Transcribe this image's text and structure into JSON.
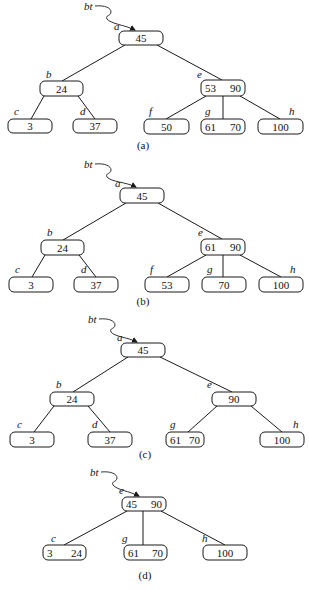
{
  "figure": {
    "pointer_label": "bt",
    "panels": [
      {
        "id": "a",
        "caption": "(a)",
        "caption_pos": [
          143,
          149
        ],
        "pointer": {
          "label_pos": [
            84,
            10
          ],
          "tip": [
            135,
            31
          ]
        },
        "nodes": [
          {
            "name": "a",
            "keys": [
              "45"
            ],
            "box": [
              119,
              31,
              44,
              14
            ],
            "label_pos": [
              114,
              31
            ]
          },
          {
            "name": "b",
            "keys": [
              "24"
            ],
            "box": [
              40,
              81,
              43,
              15
            ],
            "label_pos": [
              46,
              79
            ]
          },
          {
            "name": "c",
            "keys": [
              "3"
            ],
            "box": [
              8,
              119,
              44,
              14
            ],
            "label_pos": [
              14,
              116
            ]
          },
          {
            "name": "d",
            "keys": [
              "37"
            ],
            "box": [
              73,
              119,
              44,
              14
            ],
            "label_pos": [
              80,
              116
            ]
          },
          {
            "name": "e",
            "keys": [
              "53",
              "90"
            ],
            "box": [
              201,
              80,
              44,
              16
            ],
            "label_pos": [
              197,
              79
            ]
          },
          {
            "name": "f",
            "keys": [
              "50"
            ],
            "box": [
              144,
              119,
              45,
              15
            ],
            "label_pos": [
              149,
              116
            ]
          },
          {
            "name": "g",
            "keys": [
              "61",
              "70"
            ],
            "box": [
              201,
              119,
              44,
              15
            ],
            "label_pos": [
              205,
              116
            ]
          },
          {
            "name": "h",
            "keys": [
              "100"
            ],
            "box": [
              258,
              119,
              45,
              15
            ],
            "label_pos": [
              289,
              116
            ]
          }
        ],
        "edges": [
          [
            125,
            45,
            62,
            81
          ],
          [
            157,
            45,
            222,
            80
          ],
          [
            44,
            96,
            31,
            119
          ],
          [
            78,
            96,
            95,
            119
          ],
          [
            206,
            96,
            166,
            119
          ],
          [
            223,
            96,
            223,
            119
          ],
          [
            240,
            96,
            280,
            119
          ]
        ]
      },
      {
        "id": "b",
        "caption": "(b)",
        "caption_pos": [
          143,
          305
        ],
        "pointer": {
          "label_pos": [
            84,
            168
          ],
          "tip": [
            136,
            188
          ]
        },
        "nodes": [
          {
            "name": "a",
            "keys": [
              "45"
            ],
            "box": [
              120,
              188,
              44,
              15
            ],
            "label_pos": [
              115,
              188
            ]
          },
          {
            "name": "b",
            "keys": [
              "24"
            ],
            "box": [
              41,
              240,
              43,
              15
            ],
            "label_pos": [
              47,
              237
            ]
          },
          {
            "name": "c",
            "keys": [
              "3"
            ],
            "box": [
              9,
              277,
              44,
              15
            ],
            "label_pos": [
              15,
              274
            ]
          },
          {
            "name": "d",
            "keys": [
              "37"
            ],
            "box": [
              74,
              277,
              44,
              15
            ],
            "label_pos": [
              81,
              274
            ]
          },
          {
            "name": "e",
            "keys": [
              "61",
              "90"
            ],
            "box": [
              201,
              239,
              44,
              16
            ],
            "label_pos": [
              198,
              237
            ]
          },
          {
            "name": "f",
            "keys": [
              "53"
            ],
            "box": [
              145,
              277,
              44,
              15
            ],
            "label_pos": [
              150,
              274
            ]
          },
          {
            "name": "g",
            "keys": [
              "70"
            ],
            "box": [
              202,
              277,
              44,
              15
            ],
            "label_pos": [
              207,
              274
            ]
          },
          {
            "name": "h",
            "keys": [
              "100"
            ],
            "box": [
              259,
              277,
              44,
              15
            ],
            "label_pos": [
              290,
              274
            ]
          }
        ],
        "edges": [
          [
            126,
            203,
            63,
            240
          ],
          [
            158,
            203,
            222,
            239
          ],
          [
            45,
            255,
            32,
            277
          ],
          [
            79,
            255,
            96,
            277
          ],
          [
            206,
            255,
            167,
            277
          ],
          [
            223,
            255,
            223,
            277
          ],
          [
            240,
            255,
            281,
            277
          ]
        ]
      },
      {
        "id": "c",
        "caption": "(c)",
        "caption_pos": [
          145,
          458
        ],
        "pointer": {
          "label_pos": [
            88,
            323
          ],
          "tip": [
            137,
            343
          ]
        },
        "nodes": [
          {
            "name": "a",
            "keys": [
              "45"
            ],
            "box": [
              121,
              343,
              44,
              14
            ],
            "label_pos": [
              117,
              342
            ]
          },
          {
            "name": "b",
            "keys": [
              "24"
            ],
            "box": [
              50,
              392,
              44,
              14
            ],
            "label_pos": [
              56,
              389
            ]
          },
          {
            "name": "c",
            "keys": [
              "3"
            ],
            "box": [
              10,
              432,
              44,
              15
            ],
            "label_pos": [
              17,
              429
            ]
          },
          {
            "name": "d",
            "keys": [
              "37"
            ],
            "box": [
              88,
              432,
              44,
              15
            ],
            "label_pos": [
              92,
              429
            ]
          },
          {
            "name": "e",
            "keys": [
              "90"
            ],
            "box": [
              212,
              392,
              44,
              14
            ],
            "label_pos": [
              207,
              389
            ]
          },
          {
            "name": "g",
            "keys": [
              "61",
              "70"
            ],
            "box": [
              166,
              432,
              38,
              15
            ],
            "label_pos": [
              170,
              429
            ]
          },
          {
            "name": "h",
            "keys": [
              "100"
            ],
            "box": [
              260,
              432,
              44,
              15
            ],
            "label_pos": [
              293,
              429
            ]
          }
        ],
        "edges": [
          [
            128,
            357,
            73,
            392
          ],
          [
            160,
            357,
            232,
            392
          ],
          [
            54,
            406,
            34,
            432
          ],
          [
            88,
            406,
            110,
            432
          ],
          [
            217,
            406,
            188,
            432
          ],
          [
            251,
            406,
            282,
            432
          ]
        ]
      },
      {
        "id": "d",
        "caption": "(d)",
        "caption_pos": [
          145,
          579
        ],
        "pointer": {
          "label_pos": [
            90,
            476
          ],
          "tip": [
            139,
            497
          ]
        },
        "nodes": [
          {
            "name": "e",
            "keys": [
              "45",
              "90"
            ],
            "box": [
              122,
              497,
              44,
              14
            ],
            "label_pos": [
              119,
              495
            ]
          },
          {
            "name": "c",
            "keys": [
              "3",
              "24"
            ],
            "box": [
              43,
              545,
              43,
              15
            ],
            "label_pos": [
              51,
              543
            ]
          },
          {
            "name": "g",
            "keys": [
              "61",
              "70"
            ],
            "box": [
              124,
              545,
              43,
              15
            ],
            "label_pos": [
              122,
              543
            ]
          },
          {
            "name": "h",
            "keys": [
              "100"
            ],
            "box": [
              203,
              545,
              44,
              15
            ],
            "label_pos": [
              202,
              543
            ]
          }
        ],
        "edges": [
          [
            127,
            511,
            64,
            545
          ],
          [
            143,
            511,
            143,
            545
          ],
          [
            161,
            511,
            225,
            545
          ]
        ]
      }
    ]
  }
}
